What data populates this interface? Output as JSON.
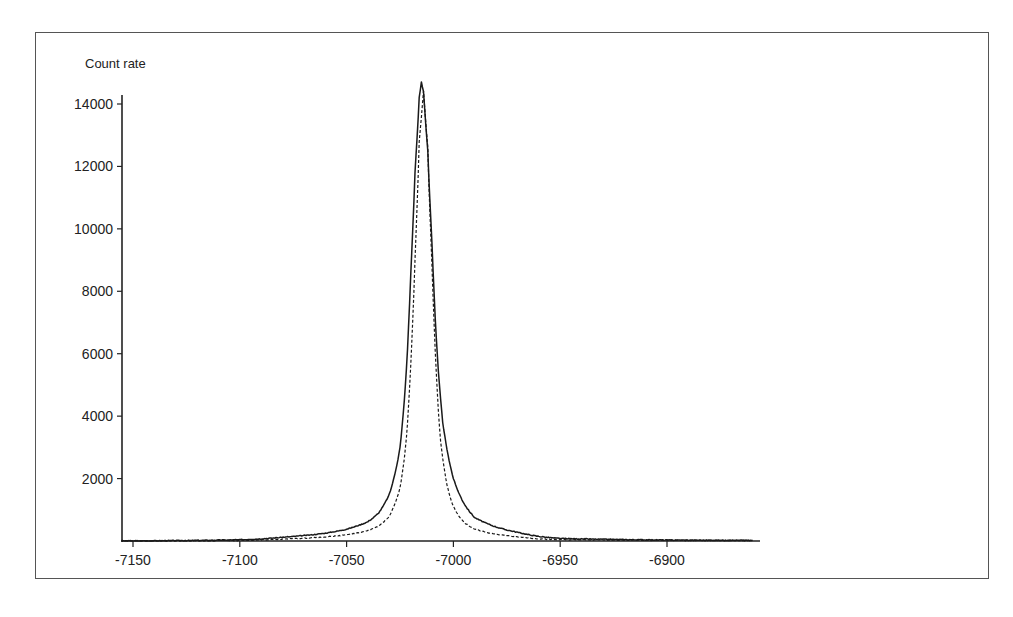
{
  "chart_data": {
    "type": "line",
    "title": "",
    "xlabel": "",
    "ylabel": "Count rate",
    "xlim": [
      -7160,
      -6860
    ],
    "ylim": [
      0,
      15000
    ],
    "grid": false,
    "legend": null,
    "x_ticks": [
      -7150,
      -7100,
      -7050,
      -7000,
      -6950,
      -6900
    ],
    "x_tick_labels": [
      "-7150",
      "-7100",
      "-7050",
      "-7000",
      "-6950",
      "-6900"
    ],
    "y_ticks": [
      2000,
      4000,
      6000,
      8000,
      10000,
      12000,
      14000
    ],
    "y_tick_labels": [
      "2000",
      "4000",
      "6000",
      "8000",
      "10000",
      "12000",
      "14000"
    ],
    "series": [
      {
        "name": "solid",
        "style": "solid",
        "peak_x": -7015,
        "peak_y": 14700,
        "x": [
          -7160,
          -7100,
          -7080,
          -7060,
          -7050,
          -7040,
          -7035,
          -7030,
          -7025,
          -7022,
          -7020,
          -7018,
          -7016,
          -7015,
          -7014,
          -7012,
          -7010,
          -7008,
          -7005,
          -7000,
          -6995,
          -6990,
          -6980,
          -6970,
          -6960,
          -6950,
          -6900,
          -6860
        ],
        "values": [
          0,
          40,
          120,
          250,
          380,
          620,
          900,
          1500,
          3000,
          5500,
          8500,
          11800,
          14200,
          14700,
          14400,
          12500,
          9500,
          6500,
          3800,
          2000,
          1200,
          750,
          450,
          280,
          150,
          80,
          30,
          20
        ]
      },
      {
        "name": "dashed",
        "style": "dashed",
        "peak_x": -7014,
        "peak_y": 14400,
        "x": [
          -7160,
          -7100,
          -7080,
          -7060,
          -7050,
          -7040,
          -7035,
          -7030,
          -7025,
          -7022,
          -7020,
          -7018,
          -7016,
          -7014,
          -7012,
          -7010,
          -7008,
          -7006,
          -7003,
          -7000,
          -6995,
          -6990,
          -6980,
          -6970,
          -6960,
          -6950,
          -6900,
          -6860
        ],
        "values": [
          0,
          20,
          60,
          130,
          200,
          330,
          480,
          800,
          1700,
          3300,
          5600,
          9000,
          12800,
          14400,
          12600,
          8800,
          5400,
          3200,
          1800,
          1100,
          600,
          380,
          220,
          130,
          70,
          40,
          20,
          15
        ]
      }
    ]
  }
}
